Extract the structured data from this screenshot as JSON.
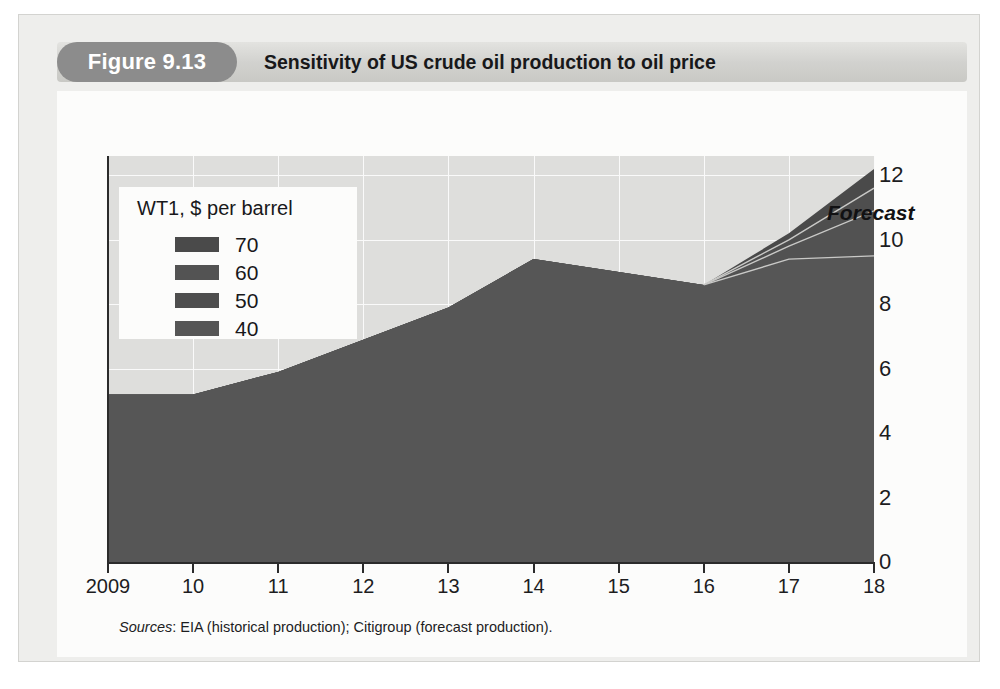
{
  "figure": {
    "tag": "Figure 9.13",
    "title": "Sensitivity of US crude oil production to oil price"
  },
  "sources": {
    "prefix": "Sources",
    "text": ": EIA (historical production); Citigroup (forecast production)."
  },
  "annotation": {
    "forecast": "Forecast"
  },
  "legend": {
    "title": "WT1, $ per barrel",
    "entries": [
      {
        "label": "70",
        "color": "#4a4a4a"
      },
      {
        "label": "60",
        "color": "#535353"
      },
      {
        "label": "50",
        "color": "#4e4e4e"
      },
      {
        "label": "40",
        "color": "#565656"
      }
    ]
  },
  "chart_data": {
    "type": "area",
    "title": "Sensitivity of US crude oil production to oil price",
    "subtitle": "",
    "xlabel": "",
    "ylabel": "",
    "grid": true,
    "legend_position": "inside-top-left",
    "x": [
      2009,
      2010,
      2011,
      2012,
      2013,
      2014,
      2015,
      2016,
      2017,
      2018
    ],
    "xtick_labels": [
      "2009",
      "10",
      "11",
      "12",
      "13",
      "14",
      "15",
      "16",
      "17",
      "18"
    ],
    "xlim": [
      2009,
      2018
    ],
    "ylim": [
      0,
      12.6
    ],
    "ytick_labels": [
      "0",
      "2",
      "4",
      "6",
      "8",
      "10",
      "12"
    ],
    "yticks": [
      0,
      2,
      4,
      6,
      8,
      10,
      12
    ],
    "forecast_start_year": 2016,
    "series": [
      {
        "name": "70",
        "color": "#4a4a4a",
        "values": [
          5.2,
          5.2,
          5.9,
          6.9,
          7.9,
          9.4,
          9.0,
          8.6,
          10.2,
          12.2
        ]
      },
      {
        "name": "60",
        "color": "#4e4e4e",
        "values": [
          5.2,
          5.2,
          5.9,
          6.9,
          7.9,
          9.4,
          9.0,
          8.6,
          10.0,
          11.6
        ]
      },
      {
        "name": "50",
        "color": "#525252",
        "values": [
          5.2,
          5.2,
          5.9,
          6.9,
          7.9,
          9.4,
          9.0,
          8.6,
          9.8,
          10.9
        ]
      },
      {
        "name": "40",
        "color": "#565656",
        "values": [
          5.2,
          5.2,
          5.9,
          6.9,
          7.9,
          9.4,
          9.0,
          8.6,
          9.4,
          9.5
        ]
      }
    ]
  },
  "colors": {
    "plot_background": "#dededc",
    "area_fill": "#4e4e4e",
    "gridline": "#fafafa",
    "axis": "#2b2b2b",
    "card": "#fcfcfb",
    "page": "#eeeeec",
    "tag_background": "#8c8c8c"
  }
}
